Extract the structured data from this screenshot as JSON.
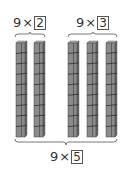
{
  "groups": [
    {
      "factor": "9",
      "operator": "×",
      "multiplier": "2",
      "rods": 2
    },
    {
      "factor": "9",
      "operator": "×",
      "multiplier": "3",
      "rods": 3
    }
  ],
  "total": {
    "factor": "9",
    "operator": "×",
    "multiplier": "5",
    "rods": 5
  },
  "rod": {
    "cubes_per_rod": 9
  },
  "colors": {
    "rod_front": "#8a8a8a",
    "rod_side": "#6a6a6a",
    "rod_top": "#b0b0b0",
    "line": "#555555",
    "text": "#333333"
  }
}
